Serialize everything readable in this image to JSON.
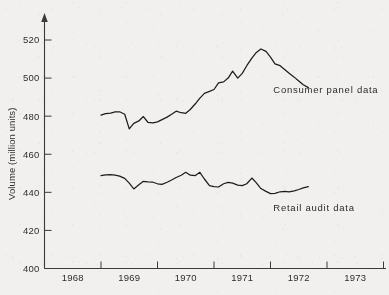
{
  "figure": {
    "background_color": "#f1f0ee",
    "ink_color": "#1d1d1d"
  },
  "chart_data": {
    "type": "line",
    "title": "",
    "subtitle": "",
    "xlabel": "",
    "ylabel": "Volume (million units)",
    "xlim": [
      1968,
      1974
    ],
    "ylim": [
      400,
      528
    ],
    "ytick_values": [
      400,
      420,
      440,
      460,
      480,
      500,
      520
    ],
    "ytick_labels": [
      "400",
      "420",
      "440",
      "460",
      "480",
      "500",
      "520"
    ],
    "ytick_step": 20,
    "xtick_boundaries": [
      1968,
      1969,
      1970,
      1971,
      1972,
      1973,
      1974
    ],
    "xtick_labels": [
      "1968",
      "1969",
      "1970",
      "1971",
      "1972",
      "1973"
    ],
    "x_label_placement": "centered-between-ticks",
    "grid": false,
    "legend": "inline-annotations",
    "y_axis_arrow": true,
    "series": [
      {
        "name": "Consumer panel data",
        "annotation": "Consumer panel data",
        "annotation_x": 1972.05,
        "annotation_y": 492,
        "x": [
          1969.0,
          1969.08,
          1969.17,
          1969.25,
          1969.33,
          1969.42,
          1969.5,
          1969.58,
          1969.67,
          1969.75,
          1969.83,
          1969.92,
          1970.0,
          1970.08,
          1970.17,
          1970.25,
          1970.33,
          1970.42,
          1970.5,
          1970.58,
          1970.67,
          1970.75,
          1970.83,
          1970.92,
          1971.0,
          1971.08,
          1971.17,
          1971.25,
          1971.33,
          1971.42,
          1971.5,
          1971.58,
          1971.67,
          1971.75,
          1971.83,
          1971.92,
          1972.0,
          1972.08,
          1972.17,
          1972.25,
          1972.33,
          1972.42,
          1972.5,
          1972.58,
          1972.67
        ],
        "values": [
          480.5,
          481.3,
          481.6,
          482.2,
          482.3,
          481.0,
          473.3,
          476.2,
          477.5,
          479.8,
          476.8,
          476.5,
          477.0,
          478.2,
          479.5,
          481.0,
          482.6,
          481.8,
          481.5,
          483.5,
          486.5,
          489.5,
          492.0,
          493.0,
          494.0,
          497.5,
          498.0,
          500.0,
          503.7,
          500.0,
          502.5,
          506.5,
          510.5,
          513.5,
          515.3,
          514.0,
          511.0,
          507.5,
          506.5,
          504.5,
          502.5,
          500.5,
          498.5,
          496.5,
          495.0
        ]
      },
      {
        "name": "Retail audit data",
        "annotation": "Retail audit data",
        "annotation_x": 1972.05,
        "annotation_y": 430,
        "x": [
          1969.0,
          1969.08,
          1969.17,
          1969.25,
          1969.33,
          1969.42,
          1969.5,
          1969.58,
          1969.67,
          1969.75,
          1969.83,
          1969.92,
          1970.0,
          1970.08,
          1970.17,
          1970.25,
          1970.33,
          1970.42,
          1970.5,
          1970.58,
          1970.67,
          1970.75,
          1970.83,
          1970.92,
          1971.0,
          1971.08,
          1971.17,
          1971.25,
          1971.33,
          1971.42,
          1971.5,
          1971.58,
          1971.67,
          1971.75,
          1971.83,
          1971.92,
          1972.0,
          1972.08,
          1972.17,
          1972.25,
          1972.33,
          1972.42,
          1972.5,
          1972.58,
          1972.67
        ],
        "values": [
          448.8,
          449.2,
          449.3,
          449.0,
          448.5,
          447.3,
          444.8,
          441.8,
          444.0,
          445.8,
          445.5,
          445.3,
          444.5,
          444.2,
          445.3,
          446.5,
          447.8,
          449.0,
          450.5,
          449.0,
          448.8,
          450.5,
          447.0,
          443.5,
          443.0,
          442.8,
          444.5,
          445.2,
          444.8,
          443.8,
          443.5,
          444.5,
          447.5,
          445.0,
          442.0,
          440.5,
          439.3,
          439.5,
          440.3,
          440.5,
          440.2,
          440.8,
          441.5,
          442.3,
          443.0
        ]
      }
    ]
  }
}
